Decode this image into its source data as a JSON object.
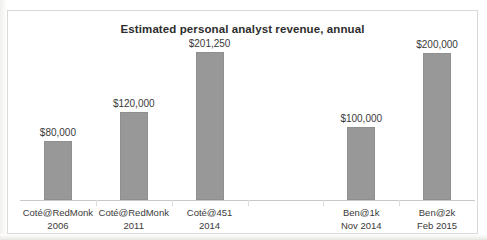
{
  "chart_data": {
    "type": "bar",
    "title": "Estimated personal analyst revenue, annual",
    "xlabel": "",
    "ylabel": "",
    "grid": false,
    "legend": "none",
    "ylim": [
      0,
      225000
    ],
    "categories": [
      "Coté@RedMonk 2006",
      "Coté@RedMonk 2011",
      "Coté@451 2014",
      "",
      "Ben@1k Nov 2014",
      "Ben@2k Feb 2015"
    ],
    "values": [
      80000,
      120000,
      201250,
      null,
      100000,
      200000
    ],
    "data_labels": [
      "$80,000",
      "$120,000",
      "$201,250",
      "",
      "$100,000",
      "$200,000"
    ],
    "bar_color": "#989898",
    "points": [
      {
        "label_line1": "Coté@RedMonk",
        "label_line2": "2006",
        "value": 80000,
        "value_label": "$80,000"
      },
      {
        "label_line1": "Coté@RedMonk",
        "label_line2": "2011",
        "value": 120000,
        "value_label": "$120,000"
      },
      {
        "label_line1": "Coté@451",
        "label_line2": "2014",
        "value": 201250,
        "value_label": "$201,250"
      },
      {
        "label_line1": "",
        "label_line2": "",
        "value": null,
        "value_label": ""
      },
      {
        "label_line1": "Ben@1k",
        "label_line2": "Nov 2014",
        "value": 100000,
        "value_label": "$100,000"
      },
      {
        "label_line1": "Ben@2k",
        "label_line2": "Feb 2015",
        "value": 200000,
        "value_label": "$200,000"
      }
    ]
  }
}
